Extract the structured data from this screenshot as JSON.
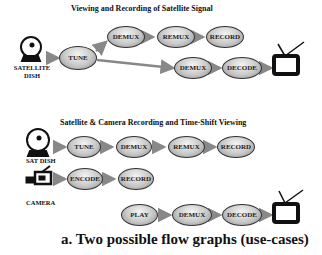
{
  "diagram1": {
    "title": "Viewing and Recording of Satellite Signal",
    "source_label": "SATELLITE DISH",
    "nodes": {
      "tune": "TUNE",
      "demux_a": "DEMUX",
      "remux": "REMUX",
      "record": "RECORD",
      "demux_b": "DEMUX",
      "decode": "DECODE"
    }
  },
  "diagram2": {
    "title": "Satellite & Camera Recording and Time-Shift Viewing",
    "sat_label": "SAT DISH",
    "camera_label": "CAMERA",
    "nodes": {
      "tune": "TUNE",
      "demux_a": "DEMUX",
      "remux": "REMUX",
      "record_a": "RECORD",
      "encode": "ENCODE",
      "record_b": "RECORD",
      "play": "PLAY",
      "demux_b": "DEMUX",
      "decode": "DECODE"
    }
  },
  "caption": "a. Two possible flow graphs (use-cases)"
}
